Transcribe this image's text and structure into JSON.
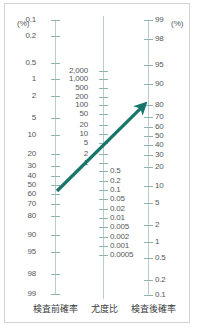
{
  "figure": {
    "type": "fagan-nomogram",
    "title_visible": false,
    "unit_left": "(%) ",
    "unit_right": " (%)",
    "accent_color": "#17766b",
    "axis_color": "#b9cdca",
    "tick_color": "#8fb4ae",
    "text_color": "#54585a",
    "border_color": "#d2d4d3"
  },
  "captions": {
    "pre": "検査前確率",
    "lr": "尤度比",
    "post": "検査後確率"
  },
  "chart_data": {
    "type": "line",
    "title": "",
    "xlabel": "",
    "ylabel": "",
    "grid": false,
    "legend_position": "none",
    "axes": [
      {
        "name": "pre_test_probability",
        "label": "検査前確率",
        "unit": "(%)",
        "side": "left",
        "direction": "increasing-downward",
        "ticks": [
          {
            "label": "0.1",
            "y": 16
          },
          {
            "label": "0.2",
            "y": 32
          },
          {
            "label": "0.5",
            "y": 59
          },
          {
            "label": "1",
            "y": 75
          },
          {
            "label": "2",
            "y": 92
          },
          {
            "label": "5",
            "y": 114
          },
          {
            "label": "10",
            "y": 131
          },
          {
            "label": "20",
            "y": 150
          },
          {
            "label": "30",
            "y": 162
          },
          {
            "label": "40",
            "y": 172
          },
          {
            "label": "50",
            "y": 181
          },
          {
            "label": "60",
            "y": 190
          },
          {
            "label": "70",
            "y": 200
          },
          {
            "label": "80",
            "y": 212
          },
          {
            "label": "90",
            "y": 231
          },
          {
            "label": "95",
            "y": 248
          },
          {
            "label": "98",
            "y": 270
          },
          {
            "label": "99",
            "y": 290
          }
        ]
      },
      {
        "name": "likelihood_ratio",
        "label": "尤度比",
        "unit": "",
        "side": "center",
        "direction": "decreasing-downward",
        "ticks": [
          {
            "label": "2,000",
            "y": 67,
            "align": "up"
          },
          {
            "label": "1,000",
            "y": 75,
            "align": "up"
          },
          {
            "label": "500",
            "y": 84,
            "align": "up"
          },
          {
            "label": "200",
            "y": 93,
            "align": "up"
          },
          {
            "label": "100",
            "y": 101,
            "align": "up"
          },
          {
            "label": "50",
            "y": 110,
            "align": "up"
          },
          {
            "label": "20",
            "y": 121,
            "align": "up"
          },
          {
            "label": "10",
            "y": 130,
            "align": "up"
          },
          {
            "label": "5",
            "y": 139,
            "align": "up"
          },
          {
            "label": "2",
            "y": 150,
            "align": "up"
          },
          {
            "label": "1",
            "y": 159,
            "align": "up"
          },
          {
            "label": "0.5",
            "y": 167,
            "align": "down"
          },
          {
            "label": "0.2",
            "y": 177,
            "align": "down"
          },
          {
            "label": "0.1",
            "y": 186,
            "align": "down"
          },
          {
            "label": "0.05",
            "y": 195,
            "align": "down"
          },
          {
            "label": "0.02",
            "y": 205,
            "align": "down"
          },
          {
            "label": "0.01",
            "y": 214,
            "align": "down"
          },
          {
            "label": "0.005",
            "y": 223,
            "align": "down"
          },
          {
            "label": "0.002",
            "y": 233,
            "align": "down"
          },
          {
            "label": "0.001",
            "y": 242,
            "align": "down"
          },
          {
            "label": "0.0005",
            "y": 251,
            "align": "down"
          }
        ]
      },
      {
        "name": "post_test_probability",
        "label": "検査後確率",
        "unit": "(%)",
        "side": "right",
        "direction": "decreasing-downward",
        "ticks": [
          {
            "label": "99",
            "y": 16
          },
          {
            "label": "98",
            "y": 35
          },
          {
            "label": "95",
            "y": 61
          },
          {
            "label": "90",
            "y": 80
          },
          {
            "label": "80",
            "y": 101
          },
          {
            "label": "70",
            "y": 113
          },
          {
            "label": "60",
            "y": 123
          },
          {
            "label": "50",
            "y": 132
          },
          {
            "label": "40",
            "y": 141
          },
          {
            "label": "30",
            "y": 151
          },
          {
            "label": "20",
            "y": 163
          },
          {
            "label": "10",
            "y": 182
          },
          {
            "label": "5",
            "y": 199
          },
          {
            "label": "2",
            "y": 221
          },
          {
            "label": "1",
            "y": 238
          },
          {
            "label": "0.5",
            "y": 254
          },
          {
            "label": "0.2",
            "y": 276
          },
          {
            "label": "0.1",
            "y": 291
          }
        ]
      }
    ],
    "annotation": {
      "name": "result-arrow",
      "kind": "arrow",
      "color": "#17766b",
      "from": {
        "axis": "pre_test_probability",
        "value": "55",
        "x": 52,
        "y": 187
      },
      "to": {
        "axis": "post_test_probability",
        "value": "80",
        "x": 141,
        "y": 99
      },
      "passes_through": {
        "axis": "likelihood_ratio",
        "value": "3.5"
      }
    }
  }
}
